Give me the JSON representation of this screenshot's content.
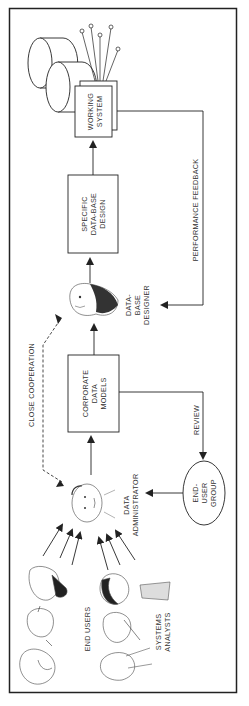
{
  "diagram": {
    "orientation": "rotated-90-ccw",
    "nodes": {
      "working_system": {
        "line1": "WORKING",
        "line2": "SYSTEM"
      },
      "specific_db_design": {
        "line1": "SPECIFIC",
        "line2": "DATA-BASE",
        "line3": "DESIGN"
      },
      "db_designer": {
        "line1": "DATA-",
        "line2": "BASE",
        "line3": "DESIGNER"
      },
      "corporate_data_models": {
        "line1": "CORPORATE",
        "line2": "DATA",
        "line3": "MODELS"
      },
      "data_administrator": {
        "line1": "DATA",
        "line2": "ADMINISTRATOR"
      },
      "end_user_group": {
        "line1": "END-",
        "line2": "USER",
        "line3": "GROUP"
      },
      "end_users": {
        "label": "END USERS"
      },
      "systems_analysts": {
        "line1": "SYSTEMS",
        "line2": "ANALYSTS"
      }
    },
    "edges": {
      "performance_feedback": "PERFORMANCE FEEDBACK",
      "review": "REVIEW",
      "close_cooperation": "CLOSE COOPERATION"
    },
    "colors": {
      "line": "#2a2a2a",
      "text": "#333333",
      "background": "#ffffff"
    }
  }
}
